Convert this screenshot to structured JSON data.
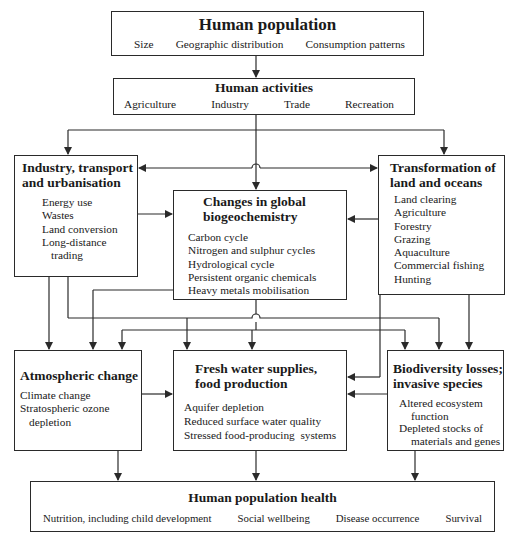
{
  "diagram": {
    "human_population": {
      "title": "Human population",
      "items": [
        "Size",
        "Geographic distribution",
        "Consumption patterns"
      ]
    },
    "human_activities": {
      "title": "Human activities",
      "items": [
        "Agriculture",
        "Industry",
        "Trade",
        "Recreation"
      ]
    },
    "industry": {
      "title_line1": "Industry, transport",
      "title_line2": "and urbanisation",
      "items": [
        "Energy use",
        "Wastes",
        "Land conversion",
        "Long-distance",
        "trading"
      ]
    },
    "biogeochemistry": {
      "title_line1": "Changes in global",
      "title_line2": "biogeochemistry",
      "items": [
        "Carbon cycle",
        "Nitrogen and sulphur cycles",
        "Hydrological cycle",
        "Persistent organic chemicals",
        "Heavy metals mobilisation"
      ]
    },
    "transformation": {
      "title_line1": "Transformation of",
      "title_line2": "land and oceans",
      "items": [
        "Land clearing",
        "Agriculture",
        "Forestry",
        "Grazing",
        "Aquaculture",
        "Commercial fishing",
        "Hunting"
      ]
    },
    "atmospheric": {
      "title": "Atmospheric change",
      "items": [
        "Climate change",
        "Stratospheric ozone",
        "depletion"
      ]
    },
    "freshwater": {
      "title_line1": "Fresh water supplies,",
      "title_line2": "food production",
      "items": [
        "Aquifer depletion",
        "Reduced surface water quality",
        "Stressed food-producing  systems"
      ]
    },
    "biodiversity": {
      "title_line1": "Biodiversity losses;",
      "title_line2": "invasive species",
      "items": [
        "Altered ecosystem",
        "function",
        "Depleted stocks of",
        "materials and genes"
      ]
    },
    "health": {
      "title": "Human population health",
      "items": [
        "Nutrition, including child development",
        "Social wellbeing",
        "Disease occurrence",
        "Survival"
      ]
    }
  },
  "colors": {
    "line": "#2a2a2a",
    "background": "#ffffff"
  }
}
